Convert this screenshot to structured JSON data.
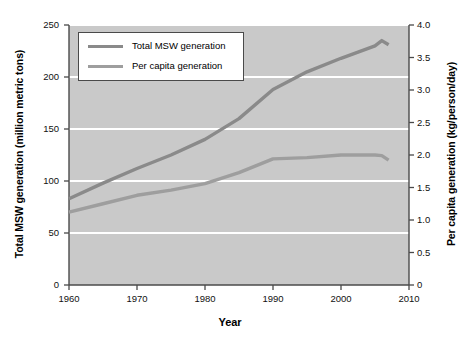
{
  "chart_data": {
    "type": "line",
    "title": "",
    "xlabel": "Year",
    "ylabel": "Total MSW generation (million metric tons)",
    "ylabel_right": "Per capita generation (kg/person/day)",
    "xlim": [
      1960,
      2010
    ],
    "ylim": [
      0,
      250
    ],
    "ylim_right": [
      0,
      4.0
    ],
    "xticks": [
      1960,
      1970,
      1980,
      1990,
      2000,
      2010
    ],
    "xtick_labels": [
      "1960",
      "1970",
      "1980",
      "1990",
      "2000",
      "2010"
    ],
    "yticks": [
      0,
      50,
      100,
      150,
      200,
      250
    ],
    "ytick_labels": [
      "0",
      "50",
      "100",
      "150",
      "200",
      "250"
    ],
    "yticks_right": [
      0,
      0.5,
      1.0,
      1.5,
      2.0,
      2.5,
      3.0,
      3.5,
      4.0
    ],
    "ytick_right_labels": [
      "0",
      "0.5",
      "1.0",
      "1.5",
      "2.0",
      "2.5",
      "3.0",
      "3.5",
      "4.0"
    ],
    "grid": true,
    "grid_color": "#ffffff",
    "plot_background": "#c9c9c9",
    "legend_position": "upper left",
    "series": [
      {
        "name": "Total MSW generation",
        "axis": "left",
        "units": "million metric tons",
        "color": "#8a8a8a",
        "x": [
          1960,
          1965,
          1970,
          1975,
          1980,
          1985,
          1990,
          1995,
          2000,
          2005,
          2006,
          2007
        ],
        "values": [
          83,
          98,
          112,
          125,
          140,
          160,
          188,
          205,
          218,
          230,
          235,
          231
        ]
      },
      {
        "name": "Per capita generation",
        "axis": "right",
        "units": "kg/person/day",
        "color": "#9e9e9e",
        "x": [
          1960,
          1965,
          1970,
          1975,
          1980,
          1985,
          1990,
          1995,
          2000,
          2005,
          2006,
          2007
        ],
        "values": [
          1.12,
          1.25,
          1.38,
          1.46,
          1.56,
          1.73,
          1.94,
          1.96,
          2.0,
          2.0,
          1.99,
          1.92
        ]
      }
    ]
  },
  "legend": {
    "items": [
      {
        "label": "Total MSW generation",
        "color": "#8a8a8a"
      },
      {
        "label": "Per capita generation",
        "color": "#9e9e9e"
      }
    ]
  },
  "axes": {
    "x_title": "Year",
    "y_left_title": "Total MSW generation (million metric tons)",
    "y_right_title": "Per capita generation (kg/person/day)"
  }
}
